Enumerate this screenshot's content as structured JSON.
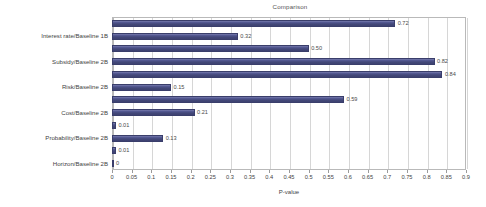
{
  "chart_data": {
    "type": "bar",
    "orientation": "horizontal",
    "title": "Comparison",
    "xlabel": "P-value",
    "ylabel": "",
    "xlim": [
      0,
      0.9
    ],
    "xticks": [
      0,
      0.05,
      0.1,
      0.15,
      0.2,
      0.25,
      0.3,
      0.35,
      0.4,
      0.45,
      0.5,
      0.55,
      0.6,
      0.65,
      0.7,
      0.75,
      0.8,
      0.85,
      0.9
    ],
    "xtick_labels": [
      "0",
      "0.05",
      "0.1",
      "0.15",
      "0.2",
      "0.25",
      "0.3",
      "0.35",
      "0.4",
      "0.45",
      "0.5",
      "0.55",
      "0.6",
      "0.65",
      "0.7",
      "0.75",
      "0.8",
      "0.85",
      "0.9"
    ],
    "grid": true,
    "grid_axis": "x",
    "legend": false,
    "bar_color": "#4b4f86",
    "values": [
      0.72,
      0.32,
      0.5,
      0.82,
      0.84,
      0.15,
      0.59,
      0.21,
      0.01,
      0.13,
      0.01,
      0
    ],
    "value_labels": [
      "0.72",
      "0.32",
      "0.50",
      "0.82",
      "0.84",
      "0.15",
      "0.59",
      "0.21",
      "0.01",
      "0.13",
      "0.01",
      "0"
    ],
    "categories": [
      "",
      "Interest rate/Baseline 1B",
      "",
      "Subsidy/Baseline 2B",
      "",
      "Risk/Baseline 2B",
      "",
      "Cost/Baseline 2B",
      "",
      "Probability/Baseline 2B",
      "",
      "Horizon/Baseline 2B"
    ],
    "axis_tick_labels_shown": [
      "Interest rate/Baseline 1B",
      "Subsidy/Baseline 2B",
      "Risk/Baseline 2B",
      "Cost/Baseline 2B",
      "Probability/Baseline 2B",
      "Horizon/Baseline 2B"
    ]
  }
}
